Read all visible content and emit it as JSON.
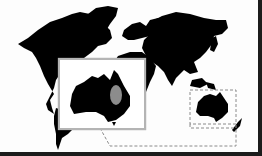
{
  "map": {
    "type": "world-silhouette",
    "land_color": "#000000",
    "ocean_color": "#fdfdfd",
    "frame_color": "#1c1c1c"
  },
  "highlight": {
    "region": "Australia",
    "box_style": "dashed",
    "box_color": "#8a8a8a"
  },
  "inset": {
    "subject": "Australia",
    "border_color": "#b4b4b4",
    "highlight_color": "#8c8c8c"
  }
}
